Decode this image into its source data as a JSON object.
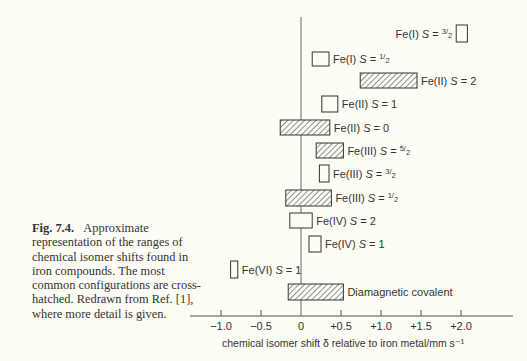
{
  "caption": {
    "fig_label": "Fig. 7.4.",
    "text": "Approximate representation of the ranges of chemical isomer shifts found in iron compounds. The most common configurations are cross-hatched. Redrawn from Ref. [1], where more detail is given."
  },
  "chart_data": {
    "type": "bar",
    "orientation": "horizontal-range",
    "title": "",
    "xlabel": "chemical isomer shift δ relative to iron metal/mm s⁻¹",
    "ylabel": "",
    "xlim": [
      -1.4,
      2.65
    ],
    "xticks": [
      -1.0,
      -0.5,
      0,
      0.5,
      1.0,
      1.5,
      2.0
    ],
    "xtick_labels": [
      "−1.0",
      "−0.5",
      "0",
      "+0.5",
      "+1.0",
      "+1.5",
      "+2.0"
    ],
    "grid": false,
    "legend": "cross-hatched = most common configurations",
    "categories": [
      "Fe(I) S = 3/2",
      "Fe(I) S = 1/2",
      "Fe(II) S = 2",
      "Fe(II) S = 1",
      "Fe(II) S = 0",
      "Fe(III) S = 5/2",
      "Fe(III) S = 3/2",
      "Fe(III) S = 1/2",
      "Fe(IV) S = 2",
      "Fe(IV) S = 1",
      "Fe(VI) S = 1",
      "Diamagnetic covalent"
    ],
    "ranges": [
      {
        "ox": "Fe(I)",
        "spin_n": "3",
        "spin_d": "2",
        "label_side": "left",
        "min": 1.94,
        "max": 2.08,
        "hatched": false,
        "y": 25,
        "h": 17
      },
      {
        "ox": "Fe(I)",
        "spin_n": "1",
        "spin_d": "2",
        "label_side": "right",
        "min": 0.14,
        "max": 0.35,
        "hatched": false,
        "y": 52,
        "h": 14
      },
      {
        "ox": "Fe(II)",
        "spin": "2",
        "label_side": "right",
        "min": 0.74,
        "max": 1.45,
        "hatched": true,
        "y": 73,
        "h": 15
      },
      {
        "ox": "Fe(II)",
        "spin": "1",
        "label_side": "right",
        "min": 0.26,
        "max": 0.46,
        "hatched": false,
        "y": 96,
        "h": 16
      },
      {
        "ox": "Fe(II)",
        "spin": "0",
        "label_side": "right",
        "min": -0.26,
        "max": 0.36,
        "hatched": true,
        "y": 120,
        "h": 15
      },
      {
        "ox": "Fe(III)",
        "spin_n": "5",
        "spin_d": "2",
        "label_side": "right",
        "min": 0.19,
        "max": 0.53,
        "hatched": true,
        "y": 143,
        "h": 15
      },
      {
        "ox": "Fe(III)",
        "spin_n": "3",
        "spin_d": "2",
        "label_side": "right",
        "min": 0.23,
        "max": 0.35,
        "hatched": false,
        "y": 165,
        "h": 17
      },
      {
        "ox": "Fe(III)",
        "spin_n": "1",
        "spin_d": "2",
        "label_side": "right",
        "min": -0.19,
        "max": 0.38,
        "hatched": true,
        "y": 190,
        "h": 16
      },
      {
        "ox": "Fe(IV)",
        "spin": "2",
        "label_side": "right",
        "min": -0.14,
        "max": 0.14,
        "hatched": false,
        "y": 213,
        "h": 15
      },
      {
        "ox": "Fe(IV)",
        "spin": "1",
        "label_side": "right",
        "min": 0.1,
        "max": 0.25,
        "hatched": false,
        "y": 236,
        "h": 16
      },
      {
        "ox": "Fe(VI)",
        "spin": "1",
        "label_side": "right",
        "min": -0.88,
        "max": -0.79,
        "hatched": false,
        "y": 261,
        "h": 17
      },
      {
        "ox": "Diamagnetic covalent",
        "label_side": "right",
        "min": -0.16,
        "max": 0.53,
        "hatched": true,
        "y": 284,
        "h": 16
      }
    ]
  }
}
